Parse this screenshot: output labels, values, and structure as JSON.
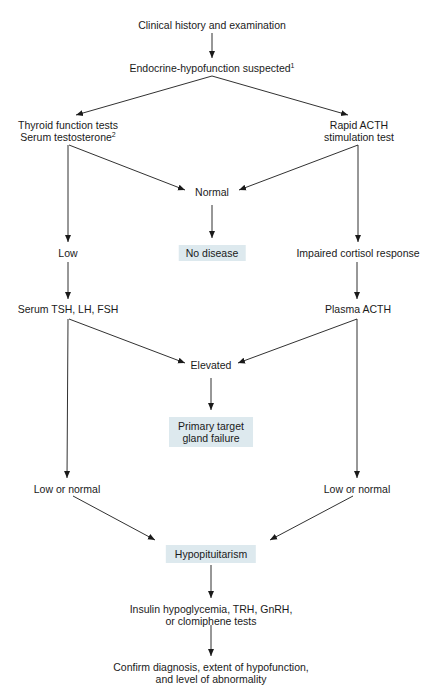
{
  "diagram": {
    "colors": {
      "highlight_box": "#dde9ee",
      "line": "#1a1a1a"
    },
    "nodes": {
      "clinical_history": "Clinical history and examination",
      "endocrine_suspected": "Endocrine-hypofunction suspected",
      "endocrine_suspected_sup": "1",
      "thyroid_line1": "Thyroid function tests",
      "thyroid_line2": "Serum testosterone",
      "thyroid_sup": "2",
      "acth_line1": "Rapid ACTH",
      "acth_line2": "stimulation test",
      "normal": "Normal",
      "low": "Low",
      "no_disease": "No disease",
      "impaired_cortisol": "Impaired cortisol response",
      "serum_tsh": "Serum TSH, LH, FSH",
      "plasma_acth": "Plasma ACTH",
      "elevated": "Elevated",
      "primary_line1": "Primary target",
      "primary_line2": "gland failure",
      "low_normal_left": "Low or normal",
      "low_normal_right": "Low or normal",
      "hypopituitarism": "Hypopituitarism",
      "insulin_line1": "Insulin hypoglycemia, TRH, GnRH,",
      "insulin_line2": "or clomiphene tests",
      "confirm_line1": "Confirm diagnosis, extent of hypofunction,",
      "confirm_line2": "and level of abnormality"
    }
  }
}
